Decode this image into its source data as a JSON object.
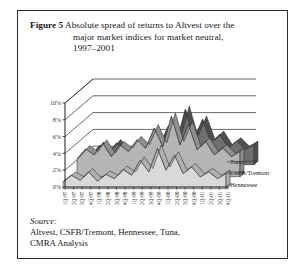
{
  "figure": {
    "number_label": "Figure 5",
    "caption_line1": "Absolute spread of returns to Altvest over the",
    "caption_line2": "major market indices for market neutral,",
    "caption_line3": "1997–2001"
  },
  "source": {
    "label": "Source:",
    "line1": " Altvest, CSFB/Tremont, Hennessee, Tuna,",
    "line2": "CMRA Analysis"
  },
  "colors": {
    "frame": "#2a2a2a",
    "text": "#161616",
    "series_tuna_top": "#6f6f6f",
    "series_tuna_side": "#4f4f4f",
    "series_csfb_top": "#b5b5b5",
    "series_csfb_side": "#8f8f8f",
    "series_hennessee_top": "#d9d9d9",
    "series_hennessee_side": "#b0b0b0",
    "gridline": "#2b2b2b",
    "wall": "#ffffff"
  },
  "chart_data": {
    "type": "area",
    "title": "Absolute spread of returns to Altvest over the major market indices for market neutral, 1997–2001",
    "xlabel": "",
    "ylabel": "",
    "ylim": [
      0,
      10
    ],
    "yticks": [
      0,
      2,
      4,
      6,
      8,
      10
    ],
    "ytick_labels": [
      "0%",
      "2%",
      "4%",
      "6%",
      "8%",
      "10%"
    ],
    "grid": true,
    "legend_position": "right-inline",
    "categories": [
      "1Q-97",
      "2Q-97",
      "3Q-97",
      "4Q-97",
      "1Q-98",
      "2Q-98",
      "3Q-98",
      "4Q-98",
      "1Q-99",
      "2Q-99",
      "3Q-99",
      "4Q-99",
      "1Q-00",
      "2Q-00",
      "3Q-00",
      "4Q-00",
      "1Q-01",
      "2Q-01",
      "3Q-01",
      "4Q-01"
    ],
    "series": [
      {
        "name": "Tuna",
        "values": [
          1.0,
          2.3,
          1.4,
          2.6,
          1.3,
          2.2,
          1.6,
          3.0,
          2.2,
          4.6,
          2.8,
          6.6,
          3.0,
          5.4,
          2.6,
          3.6,
          2.0,
          2.8,
          1.8,
          2.4
        ]
      },
      {
        "name": "CSFB/Tremont",
        "values": [
          2.1,
          3.3,
          2.6,
          4.0,
          2.4,
          3.8,
          3.0,
          4.4,
          3.4,
          5.8,
          3.6,
          7.2,
          3.8,
          6.2,
          3.2,
          4.2,
          2.6,
          3.4,
          2.4,
          3.0
        ]
      },
      {
        "name": "Hennessee",
        "values": [
          0.8,
          1.6,
          1.0,
          2.0,
          0.9,
          1.7,
          1.2,
          2.3,
          1.6,
          3.4,
          2.0,
          4.8,
          2.2,
          4.0,
          1.8,
          2.6,
          1.4,
          2.0,
          1.2,
          1.8
        ]
      }
    ]
  }
}
